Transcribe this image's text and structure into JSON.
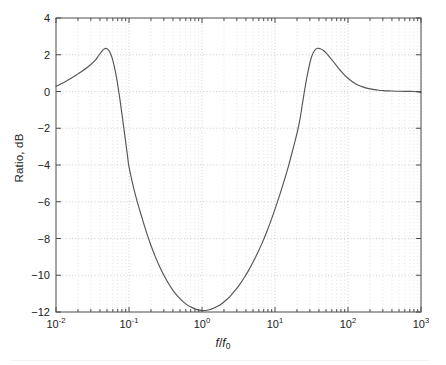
{
  "figure": {
    "y_axis_title": "Ratio, dB",
    "x_axis_title_num": "f",
    "x_axis_title_den": "f",
    "x_axis_title_sub": "0",
    "x_axis_title_plain": "f/f0"
  },
  "chart_data": {
    "type": "line",
    "title": "",
    "xlabel": "f/f0",
    "ylabel": "Ratio, dB",
    "xscale": "log",
    "yscale": "linear",
    "xlim": [
      0.01,
      1000
    ],
    "ylim": [
      -12,
      4
    ],
    "grid": true,
    "grid_style": "dotted",
    "legend": "none",
    "x_tick_labels": [
      "10-2",
      "10-1",
      "100",
      "101",
      "102",
      "103"
    ],
    "x_tick_mantissa": [
      "10",
      "10",
      "10",
      "10",
      "10",
      "10"
    ],
    "x_tick_exponents": [
      "-2",
      "-1",
      "0",
      "1",
      "2",
      "3"
    ],
    "x_tick_values": [
      0.01,
      0.1,
      1,
      10,
      100,
      1000
    ],
    "y_tick_labels": [
      "4",
      "2",
      "0",
      "-2",
      "-4",
      "-6",
      "-8",
      "-10",
      "-12"
    ],
    "y_tick_values": [
      4,
      2,
      0,
      -2,
      -4,
      -6,
      -8,
      -10,
      -12
    ],
    "y_tick_step": 2,
    "line_color": "#555555",
    "grid_color": "#b9b9b9",
    "axis_color": "#4d4d4d",
    "annotations": {
      "left_peak": {
        "x": 0.041,
        "y": 2.35
      },
      "right_peak": {
        "x": 24.0,
        "y": 2.35
      },
      "notch_min": {
        "x": 1.0,
        "y": -11.92
      },
      "left_start": {
        "x": 0.01,
        "y": 0.28
      },
      "right_end": {
        "x": 1000.0,
        "y": -0.05
      }
    },
    "x": [
      0.01,
      0.0115,
      0.0132,
      0.0152,
      0.0174,
      0.02,
      0.023,
      0.0264,
      0.0303,
      0.0348,
      0.0363,
      0.038,
      0.0398,
      0.0417,
      0.0437,
      0.0457,
      0.0479,
      0.0501,
      0.0525,
      0.055,
      0.0575,
      0.0603,
      0.0631,
      0.0661,
      0.0692,
      0.0724,
      0.0759,
      0.0794,
      0.0832,
      0.0871,
      0.0912,
      0.0955,
      0.1,
      0.115,
      0.132,
      0.152,
      0.174,
      0.2,
      0.23,
      0.264,
      0.303,
      0.348,
      0.4,
      0.46,
      0.528,
      0.606,
      0.696,
      0.8,
      0.918,
      1.0,
      1.09,
      1.26,
      1.44,
      1.66,
      1.9,
      2.19,
      2.51,
      2.88,
      3.31,
      3.8,
      4.37,
      5.01,
      5.75,
      6.61,
      7.59,
      8.71,
      10.0,
      11.5,
      13.2,
      15.2,
      17.4,
      20.0,
      22.0,
      24.0,
      26.3,
      28.8,
      31.6,
      34.7,
      38.0,
      41.7,
      45.7,
      50.1,
      57.5,
      66.1,
      75.9,
      87.1,
      100,
      115,
      132,
      152,
      174,
      200,
      230,
      264,
      303,
      348,
      400,
      500,
      630,
      800,
      1000
    ],
    "y": [
      0.28,
      0.4,
      0.52,
      0.66,
      0.8,
      0.96,
      1.12,
      1.29,
      1.48,
      1.72,
      1.82,
      1.93,
      2.04,
      2.15,
      2.25,
      2.32,
      2.35,
      2.33,
      2.25,
      2.12,
      1.93,
      1.67,
      1.34,
      0.95,
      0.5,
      0.0,
      -0.55,
      -1.12,
      -1.72,
      -2.32,
      -2.92,
      -3.52,
      -4.1,
      -5.2,
      -6.1,
      -6.92,
      -7.68,
      -8.38,
      -9.0,
      -9.55,
      -10.03,
      -10.45,
      -10.82,
      -11.12,
      -11.37,
      -11.57,
      -11.72,
      -11.83,
      -11.9,
      -11.92,
      -11.92,
      -11.88,
      -11.8,
      -11.68,
      -11.52,
      -11.32,
      -11.08,
      -10.8,
      -10.48,
      -10.12,
      -9.72,
      -9.28,
      -8.8,
      -8.28,
      -7.7,
      -7.08,
      -6.4,
      -5.68,
      -4.92,
      -4.1,
      -3.22,
      -2.28,
      -1.5,
      -0.55,
      0.4,
      1.22,
      1.88,
      2.22,
      2.35,
      2.33,
      2.24,
      2.1,
      1.82,
      1.52,
      1.22,
      0.95,
      0.72,
      0.53,
      0.38,
      0.28,
      0.2,
      0.14,
      0.1,
      0.07,
      0.05,
      0.035,
      0.025,
      0.012,
      0.005,
      0.0,
      -0.05
    ]
  }
}
